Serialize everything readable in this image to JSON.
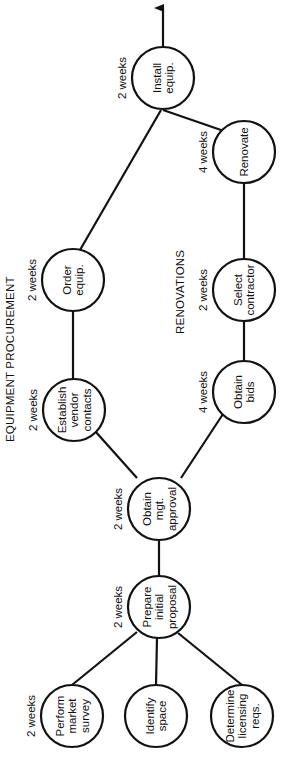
{
  "diagram": {
    "sections": {
      "equipment": "EQUIPMENT PROCUREMENT",
      "renovations": "RENOVATIONS"
    },
    "nodes": [
      {
        "id": "install",
        "lines": [
          "Install",
          "equip."
        ],
        "duration": "2 weeks",
        "cx": 163,
        "cy": 78
      },
      {
        "id": "renovate",
        "lines": [
          "Renovate"
        ],
        "duration": "4 weeks",
        "cx": 244,
        "cy": 152
      },
      {
        "id": "order",
        "lines": [
          "Order",
          "equip."
        ],
        "duration": "2 weeks",
        "cx": 73,
        "cy": 280
      },
      {
        "id": "select",
        "lines": [
          "Select",
          "contractor"
        ],
        "duration": "2 weeks",
        "cx": 244,
        "cy": 290
      },
      {
        "id": "vendor",
        "lines": [
          "Establish",
          "vendor",
          "contacts"
        ],
        "duration": "2 weeks",
        "cx": 74,
        "cy": 410
      },
      {
        "id": "bids",
        "lines": [
          "Obtain",
          "bids"
        ],
        "duration": "4 weeks",
        "cx": 244,
        "cy": 392
      },
      {
        "id": "approval",
        "lines": [
          "Obtain",
          "mgt.",
          "approval"
        ],
        "duration": "2 weeks",
        "cx": 159,
        "cy": 509
      },
      {
        "id": "proposal",
        "lines": [
          "Prepare",
          "initial",
          "proposal"
        ],
        "duration": "2 weeks",
        "cx": 159,
        "cy": 607
      },
      {
        "id": "survey",
        "lines": [
          "Perform",
          "market",
          "survey"
        ],
        "duration": "2 weeks",
        "cx": 72,
        "cy": 716
      },
      {
        "id": "space",
        "lines": [
          "Identify",
          "space"
        ],
        "duration": "",
        "cx": 156,
        "cy": 716
      },
      {
        "id": "licensing",
        "lines": [
          "Determine",
          "licensing",
          "reqs."
        ],
        "duration": "",
        "cx": 242,
        "cy": 716
      }
    ],
    "edges": [
      [
        "survey",
        "proposal"
      ],
      [
        "space",
        "proposal"
      ],
      [
        "licensing",
        "proposal"
      ],
      [
        "proposal",
        "approval"
      ],
      [
        "approval",
        "vendor"
      ],
      [
        "approval",
        "bids"
      ],
      [
        "vendor",
        "order"
      ],
      [
        "order",
        "install"
      ],
      [
        "bids",
        "select"
      ],
      [
        "select",
        "renovate"
      ],
      [
        "renovate",
        "install"
      ]
    ],
    "colors": {
      "stroke": "#111111",
      "background": "#ffffff"
    }
  }
}
